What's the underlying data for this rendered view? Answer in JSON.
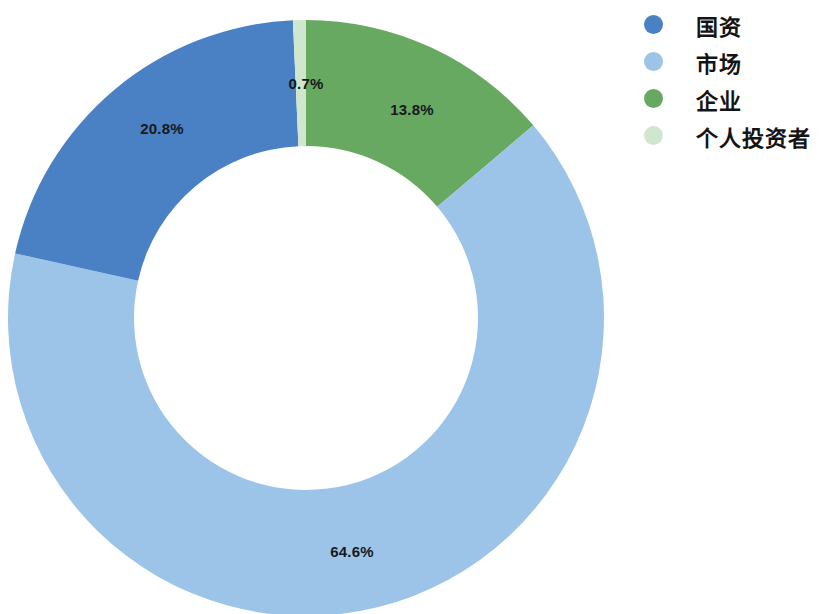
{
  "chart_data": {
    "type": "pie",
    "variant": "donut",
    "title": "",
    "subtitle": "",
    "xlabel": "",
    "ylabel": "",
    "legend_position": "right",
    "grid": false,
    "unit": "%",
    "start_angle_deg": 0,
    "direction": "clockwise",
    "categories": [
      "国资",
      "市场",
      "企业",
      "个人投资者"
    ],
    "values": [
      20.8,
      64.6,
      13.8,
      0.7
    ],
    "labels": [
      "20.8%",
      "64.6%",
      "13.8%",
      "0.7%"
    ],
    "colors": [
      "#4a81c4",
      "#9cc4e8",
      "#68a962",
      "#cfe7cd"
    ],
    "slices": [
      {
        "name": "国资",
        "value": 20.8,
        "label": "20.8%",
        "color": "#4a81c4"
      },
      {
        "name": "市场",
        "value": 64.6,
        "label": "64.6%",
        "color": "#9cc4e8"
      },
      {
        "name": "企业",
        "value": 13.8,
        "label": "13.8%",
        "color": "#68a962"
      },
      {
        "name": "个人投资者",
        "value": 0.7,
        "label": "0.7%",
        "color": "#cfe7cd"
      }
    ]
  },
  "legend": {
    "items": [
      {
        "label": "国资",
        "color": "#4a81c4"
      },
      {
        "label": "市场",
        "color": "#9cc4e8"
      },
      {
        "label": "企业",
        "color": "#68a962"
      },
      {
        "label": "个人投资者",
        "color": "#cfe7cd"
      }
    ]
  },
  "slice_labels": {
    "personal": "0.7%",
    "enterprise": "13.8%",
    "state": "20.8%",
    "market": "64.6%"
  }
}
